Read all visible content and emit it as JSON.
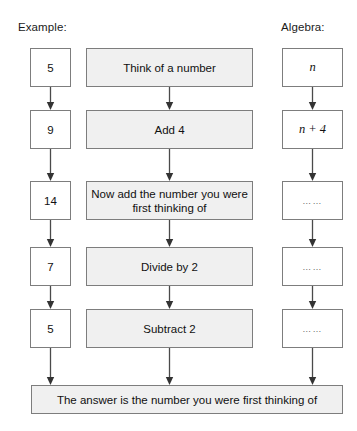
{
  "headers": {
    "example": "Example:",
    "algebra": "Algebra:"
  },
  "rows": [
    {
      "example": "5",
      "process": "Think of a number",
      "algebra": "n"
    },
    {
      "example": "9",
      "process": "Add 4",
      "algebra": "n + 4"
    },
    {
      "example": "14",
      "process": "Now add the number you were first thinking of",
      "algebra": "……"
    },
    {
      "example": "7",
      "process": "Divide by 2",
      "algebra": "……"
    },
    {
      "example": "5",
      "process": "Subtract 2",
      "algebra": "……"
    }
  ],
  "answer": "The answer is the number you were first thinking of",
  "colors": {
    "process_fill": "#f0f0f0",
    "box_border": "#7d7d7d",
    "arrow": "#4a4a4a",
    "text": "#111111",
    "background": "#ffffff"
  }
}
